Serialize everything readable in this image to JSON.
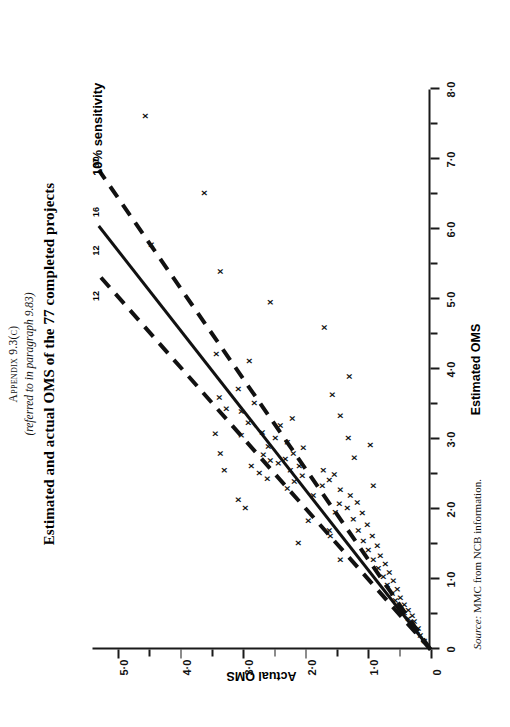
{
  "header": {
    "appendix": "Appendix  9.3(c)",
    "referred": "(referred to in paragraph 9.83)",
    "title": "Estimated and actual OMS of the 77 completed projects"
  },
  "source": {
    "label": "Source:",
    "text": "MMC from NCB information."
  },
  "annotations": {
    "sensitivity": "10% sensitivity",
    "line_labels": [
      "12",
      "12",
      "16",
      "37"
    ]
  },
  "chart_data": {
    "type": "scatter",
    "title": "Estimated and actual OMS of the 77 completed projects",
    "xlabel": "Estimated OMS",
    "ylabel": "Actual OMS",
    "xlim": [
      0,
      8.0
    ],
    "ylim": [
      0,
      5.4
    ],
    "xticks": [
      0,
      1.0,
      2.0,
      3.0,
      4.0,
      5.0,
      6.0,
      7.0,
      8.0
    ],
    "xticklabels": [
      "0",
      "1·0",
      "2·0",
      "3·0",
      "4·0",
      "5·0",
      "6·0",
      "7·0",
      "8·0"
    ],
    "xminorticks": [
      0.5,
      1.5,
      2.5,
      3.5,
      4.5,
      5.5,
      6.5,
      7.5
    ],
    "yticks": [
      0,
      1.0,
      2.0,
      3.0,
      4.0,
      5.0
    ],
    "yticklabels": [
      "0",
      "1·0",
      "2·0",
      "3·0",
      "4·0",
      "5·0"
    ],
    "yminorticks": [
      0.5,
      1.5,
      2.5,
      3.5,
      4.5
    ],
    "grid": false,
    "legend": false,
    "marker": "x",
    "points": [
      [
        0.12,
        0.1
      ],
      [
        0.2,
        0.16
      ],
      [
        0.26,
        0.22
      ],
      [
        0.3,
        0.2
      ],
      [
        0.34,
        0.3
      ],
      [
        0.4,
        0.26
      ],
      [
        0.44,
        0.36
      ],
      [
        0.48,
        0.3
      ],
      [
        0.52,
        0.42
      ],
      [
        0.56,
        0.36
      ],
      [
        0.6,
        0.5
      ],
      [
        0.64,
        0.42
      ],
      [
        0.7,
        0.56
      ],
      [
        0.74,
        0.48
      ],
      [
        0.8,
        0.62
      ],
      [
        0.86,
        0.54
      ],
      [
        0.92,
        0.7
      ],
      [
        0.98,
        0.6
      ],
      [
        1.04,
        0.76
      ],
      [
        1.1,
        0.66
      ],
      [
        1.16,
        0.84
      ],
      [
        1.22,
        0.72
      ],
      [
        1.28,
        0.92
      ],
      [
        1.34,
        0.8
      ],
      [
        1.42,
        1.0
      ],
      [
        1.48,
        0.86
      ],
      [
        1.55,
        1.08
      ],
      [
        1.62,
        0.94
      ],
      [
        1.7,
        1.16
      ],
      [
        1.78,
        1.02
      ],
      [
        1.86,
        1.24
      ],
      [
        1.95,
        1.1
      ],
      [
        2.02,
        1.34
      ],
      [
        2.1,
        1.18
      ],
      [
        1.62,
        1.6
      ],
      [
        1.7,
        1.62
      ],
      [
        1.96,
        1.52
      ],
      [
        2.08,
        1.46
      ],
      [
        2.2,
        1.28
      ],
      [
        2.28,
        1.44
      ],
      [
        2.2,
        1.88
      ],
      [
        2.34,
        1.74
      ],
      [
        2.42,
        1.62
      ],
      [
        2.5,
        1.54
      ],
      [
        2.56,
        1.72
      ],
      [
        2.3,
        2.3
      ],
      [
        2.4,
        2.18
      ],
      [
        2.48,
        2.06
      ],
      [
        2.56,
        2.24
      ],
      [
        2.62,
        2.1
      ],
      [
        2.66,
        2.44
      ],
      [
        2.72,
        2.32
      ],
      [
        2.8,
        2.2
      ],
      [
        2.88,
        2.04
      ],
      [
        2.96,
        2.3
      ],
      [
        2.44,
        2.62
      ],
      [
        2.52,
        2.74
      ],
      [
        2.62,
        2.86
      ],
      [
        2.7,
        2.56
      ],
      [
        2.78,
        2.68
      ],
      [
        2.9,
        2.6
      ],
      [
        3.02,
        2.48
      ],
      [
        3.1,
        2.7
      ],
      [
        3.2,
        2.4
      ],
      [
        3.3,
        2.22
      ],
      [
        3.06,
        3.02
      ],
      [
        3.24,
        2.92
      ],
      [
        3.4,
        3.02
      ],
      [
        3.52,
        2.82
      ],
      [
        3.44,
        3.26
      ],
      [
        2.56,
        3.3
      ],
      [
        2.8,
        3.36
      ],
      [
        3.08,
        3.44
      ],
      [
        3.6,
        3.38
      ],
      [
        3.72,
        3.08
      ],
      [
        4.12,
        2.9
      ],
      [
        4.22,
        3.42
      ],
      [
        4.6,
        1.7
      ],
      [
        4.96,
        2.56
      ],
      [
        5.4,
        3.36
      ],
      [
        5.78,
        4.46
      ],
      [
        6.52,
        3.62
      ],
      [
        7.62,
        4.56
      ],
      [
        2.02,
        2.96
      ],
      [
        2.14,
        3.08
      ],
      [
        1.84,
        1.96
      ],
      [
        2.74,
        1.22
      ],
      [
        3.02,
        1.32
      ],
      [
        3.34,
        1.44
      ],
      [
        3.64,
        1.58
      ],
      [
        3.9,
        1.3
      ],
      [
        2.92,
        0.96
      ],
      [
        2.34,
        0.92
      ],
      [
        1.52,
        2.12
      ],
      [
        1.28,
        1.44
      ]
    ],
    "lines": [
      {
        "name": "central-estimate",
        "style": "solid",
        "from": [
          0,
          0
        ],
        "to": [
          6.05,
          5.3
        ]
      },
      {
        "name": "upper-10pct-sensitivity",
        "style": "dashed",
        "from": [
          0,
          0
        ],
        "to": [
          5.35,
          5.3
        ]
      },
      {
        "name": "lower-10pct-sensitivity",
        "style": "dashed",
        "from": [
          0,
          0
        ],
        "to": [
          6.85,
          5.3
        ]
      }
    ]
  }
}
